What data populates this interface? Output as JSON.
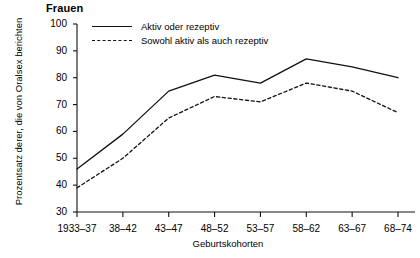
{
  "chart_data": {
    "type": "line",
    "title": "Frauen",
    "xlabel": "Geburtskohorten",
    "ylabel": "Prozentsatz derer, die von Oralsex berichten",
    "categories": [
      "1933–37",
      "38–42",
      "43–47",
      "48–52",
      "53–57",
      "58–62",
      "63–67",
      "68–74"
    ],
    "ylim": [
      30,
      100
    ],
    "yticks": [
      30,
      40,
      50,
      60,
      70,
      80,
      90,
      100
    ],
    "grid": false,
    "legend_position": "top-left-inside",
    "series": [
      {
        "name": "Aktiv oder rezeptiv",
        "style": "solid",
        "values": [
          46,
          59,
          75,
          81,
          78,
          87,
          84,
          80
        ]
      },
      {
        "name": "Sowohl aktiv als auch rezeptiv",
        "style": "dashed",
        "values": [
          39,
          50,
          65,
          73,
          71,
          78,
          75,
          67
        ]
      }
    ]
  }
}
